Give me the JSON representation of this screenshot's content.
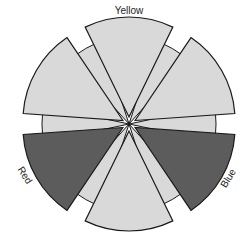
{
  "chart_data": {
    "type": "pie",
    "subtype": "exploded polar wedge / color-wheel diagram",
    "title": "",
    "center": [
      129,
      124
    ],
    "categories": [
      "Sector 1",
      "Yellow",
      "Sector 3",
      "Red",
      "Sector 5",
      "Blue"
    ],
    "segments": [
      {
        "label": "",
        "start_deg": 0,
        "end_deg": 60,
        "value": 60,
        "fill": "#d9d9d9",
        "highlighted": false
      },
      {
        "label": "Yellow",
        "start_deg": 60,
        "end_deg": 120,
        "value": 60,
        "fill": "#d9d9d9",
        "highlighted": false
      },
      {
        "label": "",
        "start_deg": 120,
        "end_deg": 180,
        "value": 60,
        "fill": "#d9d9d9",
        "highlighted": false
      },
      {
        "label": "Red",
        "start_deg": 180,
        "end_deg": 240,
        "value": 60,
        "fill": "#5c5c5c",
        "highlighted": true
      },
      {
        "label": "",
        "start_deg": 240,
        "end_deg": 300,
        "value": 60,
        "fill": "#d9d9d9",
        "highlighted": false
      },
      {
        "label": "Blue",
        "start_deg": 300,
        "end_deg": 360,
        "value": 60,
        "fill": "#5c5c5c",
        "highlighted": true
      }
    ],
    "inner_band_fill": "#d9d9d9",
    "outer_radius": 100,
    "inner_radius": 87,
    "explode_offset": 7,
    "labels": {
      "yellow": "Yellow",
      "red": "Red",
      "blue": "Blue"
    },
    "legend": "none",
    "grid": false
  },
  "colors": {
    "light": "#d9d9d9",
    "dark": "#5c5c5c",
    "stroke": "#1a1a1a"
  }
}
